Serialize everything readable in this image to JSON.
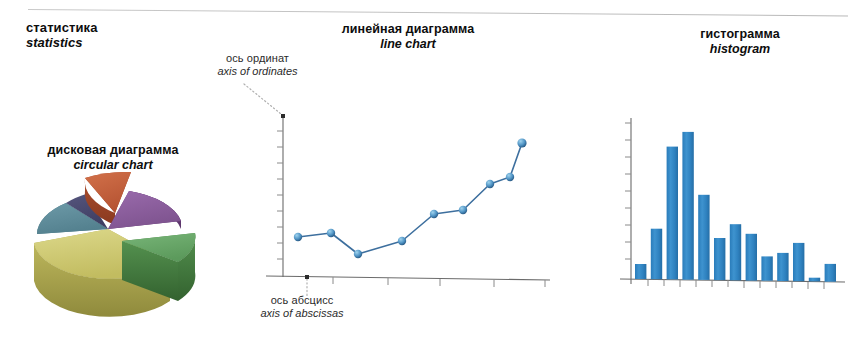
{
  "page": {
    "title_ru": "статистика",
    "title_en": "statistics",
    "divider": "top-rule"
  },
  "labels": {
    "pie": {
      "ru": "дисковая диаграмма",
      "en": "circular chart"
    },
    "line": {
      "ru": "линейная диаграмма",
      "en": "line chart"
    },
    "histogram": {
      "ru": "гистограмма",
      "en": "histogram"
    },
    "ordinate": {
      "ru": "ось ординат",
      "en": "axis of ordinates"
    },
    "abscissa": {
      "ru": "ось абсцисс",
      "en": "axis of abscissas"
    }
  },
  "colors": {
    "pie_orange": "#c4603c",
    "pie_purple": "#8f5f9e",
    "pie_green": "#6aa86a",
    "pie_yellow": "#cfc971",
    "pie_teal": "#5f8e9c",
    "pie_navy": "#4c4c72",
    "line_stroke": "#3d6f9e",
    "line_marker": "#3f7fb0",
    "bar_fill": "#2f84c4",
    "axis": "#6b6b6b",
    "leader": "#b0b0b0"
  },
  "chart_data": [
    {
      "type": "pie",
      "title": "дисковая диаграмма / circular chart",
      "style": "3d-exploded",
      "legend": "none",
      "slices": [
        {
          "name": "orange",
          "value": 11,
          "color": "#c4603c",
          "exploded": true,
          "start_deg": 303,
          "end_deg": 343
        },
        {
          "name": "purple",
          "value": 17,
          "color": "#8f5f9e",
          "exploded": false,
          "start_deg": 343,
          "end_deg": 404
        },
        {
          "name": "green",
          "value": 11,
          "color": "#6aa86a",
          "exploded": true,
          "start_deg": 44,
          "end_deg": 84
        },
        {
          "name": "yellow",
          "value": 36,
          "color": "#cfc971",
          "exploded": false,
          "start_deg": 84,
          "end_deg": 214
        },
        {
          "name": "teal",
          "value": 17,
          "color": "#5f8e9c",
          "exploded": false,
          "start_deg": 214,
          "end_deg": 275
        },
        {
          "name": "navy",
          "value": 8,
          "color": "#4c4c72",
          "exploded": false,
          "start_deg": 275,
          "end_deg": 303
        }
      ]
    },
    {
      "type": "line",
      "title": "линейная диаграмма / line chart",
      "xlabel": "ось абсцисс / axis of abscissas",
      "ylabel": "ось ординат / axis of ordinates",
      "grid": false,
      "legend": "none",
      "x": [
        1,
        2,
        3,
        4,
        5,
        6,
        7,
        8,
        9
      ],
      "values": [
        29,
        31,
        18,
        26,
        43,
        45,
        61,
        65,
        86
      ],
      "ylim": [
        0,
        100
      ],
      "y_ticks": 10,
      "x_ticks": 5,
      "markers": true
    },
    {
      "type": "bar",
      "title": "гистограмма / histogram",
      "grid": false,
      "legend": "none",
      "categories": [
        "1",
        "2",
        "3",
        "4",
        "5",
        "6",
        "7",
        "8",
        "9",
        "10",
        "11",
        "12",
        "13"
      ],
      "values": [
        16,
        54,
        142,
        158,
        91,
        45,
        60,
        50,
        26,
        30,
        41,
        4,
        19
      ],
      "ylim": [
        0,
        170
      ],
      "y_ticks": 9,
      "xlabel": "",
      "ylabel": ""
    }
  ]
}
